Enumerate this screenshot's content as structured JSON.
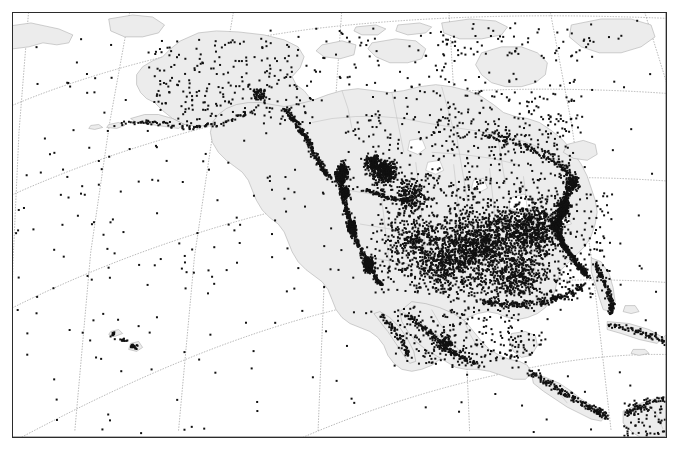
{
  "figure": {
    "kind": "map",
    "title": "",
    "projection": "Lambert conformal conic",
    "region": "North America",
    "frame": {
      "x": 12,
      "y": 12,
      "width": 655,
      "height": 426,
      "border_color": "#2b2b2b"
    },
    "background_color": "#ffffff",
    "land_fill_color": "#ececec",
    "land_outline_color": "#a9a9a9",
    "admin_border_color": "#b5b5b5",
    "graticule_color": "#9a9a9a",
    "graticule_style": "dotted",
    "point_color": "#111111",
    "point_marker": "filled-square",
    "point_size_px": 2,
    "labels": [],
    "tick_labels": [],
    "legend": []
  },
  "chart_data": {
    "type": "scatter",
    "title": "",
    "xlabel": "",
    "ylabel": "",
    "grid": true,
    "legend_position": "none",
    "projection": "Lambert conformal conic",
    "graticule": {
      "meridians_deg": [
        -180,
        -160,
        -140,
        -120,
        -100,
        -80,
        -60,
        -40
      ],
      "parallels_deg": [
        15,
        30,
        45,
        60,
        75
      ],
      "style": "dotted",
      "color": "#9a9a9a"
    },
    "axis_ranges": {
      "lon": [
        -185,
        -35
      ],
      "lat": [
        5,
        80
      ]
    },
    "series": [
      {
        "name": "stations",
        "marker": "filled-square",
        "color": "#111111",
        "count_approx": 4200,
        "density_regions": [
          {
            "region": "US Northeast / Mid-Atlantic seaboard",
            "density": "very high"
          },
          {
            "region": "US Midwest / Great Lakes",
            "density": "very high"
          },
          {
            "region": "US Southeast and Florida",
            "density": "high"
          },
          {
            "region": "US Pacific coast (California, Oregon, Washington)",
            "density": "high"
          },
          {
            "region": "Alberta / Saskatchewan prairie cluster",
            "density": "high"
          },
          {
            "region": "US Mountain West / Great Basin",
            "density": "moderate"
          },
          {
            "region": "Mexico",
            "density": "moderate"
          },
          {
            "region": "Alaska",
            "density": "low"
          },
          {
            "region": "Northern Canada / Arctic Archipelago",
            "density": "very low"
          },
          {
            "region": "Hawaii",
            "density": "small cluster"
          },
          {
            "region": "Caribbean / Central America",
            "density": "moderate"
          },
          {
            "region": "Open ocean (buoys)",
            "density": "sparse scatter"
          }
        ]
      }
    ]
  }
}
